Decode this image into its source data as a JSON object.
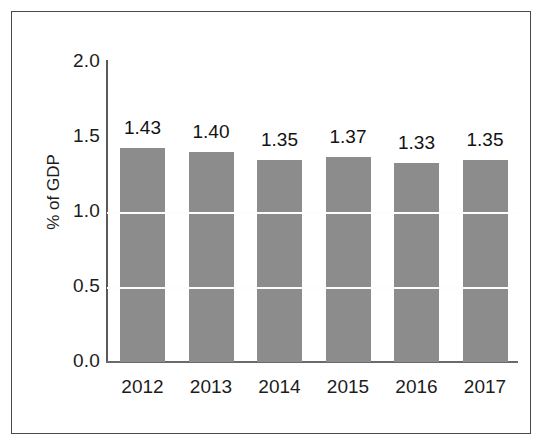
{
  "chart_data": {
    "type": "bar",
    "title": "",
    "subtitle": "",
    "xlabel": "",
    "ylabel": "% of GDP",
    "categories": [
      "2012",
      "2013",
      "2014",
      "2015",
      "2016",
      "2017"
    ],
    "values": [
      1.43,
      1.4,
      1.35,
      1.37,
      1.33,
      1.35
    ],
    "value_labels": [
      "1.43",
      "1.40",
      "1.35",
      "1.37",
      "1.33",
      "1.35"
    ],
    "ylim": [
      0.0,
      2.0
    ],
    "y_ticks": [
      {
        "value": 2.0,
        "label": "2.0"
      },
      {
        "value": 1.5,
        "label": "1.5"
      },
      {
        "value": 1.0,
        "label": "1.0"
      },
      {
        "value": 0.5,
        "label": "0.5"
      },
      {
        "value": 0.0,
        "label": "0.0"
      }
    ],
    "gridlines": [
      0.5,
      1.0
    ],
    "grid": true,
    "legend": "none",
    "bar_color": "#8c8c8c",
    "axis_color": "#5a5a5a",
    "gridline_color": "#fdfdfd",
    "text_color": "#1c1c1c",
    "background_color": "#ffffff",
    "frame_color": "#4a4a4a"
  }
}
